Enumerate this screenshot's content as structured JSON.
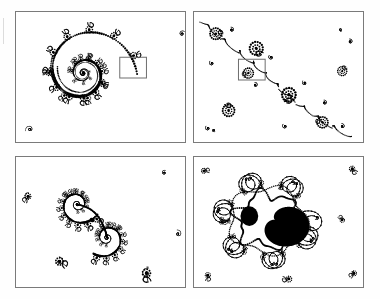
{
  "figure": {
    "background_color": "#ffffff",
    "ink_color": "#000000",
    "frame_color": "#7a7a7a",
    "zoom_box_color": "#6e6e6e",
    "columns": 2,
    "rows": 2,
    "panel_count": 4
  },
  "panels": [
    {
      "id": "panel-1",
      "index": 1,
      "position": "top-left",
      "label": "",
      "caption": "Wide view: single large logarithmic spiral of the Julia set with dendritic seahorse-tail decorations winding inward to a central focus.",
      "motif": "spiral",
      "has_zoom_box": true,
      "zoom_box": {
        "x": 120,
        "y": 57,
        "width": 27,
        "height": 21
      },
      "frame": {
        "x": 15,
        "y": 11,
        "width": 171,
        "height": 132
      }
    },
    {
      "id": "panel-2",
      "index": 2,
      "position": "top-right",
      "label": "",
      "caption": "First magnification: diagonal filament chain of bud clusters and counter-rotating mini spirals running from upper-left to lower-right.",
      "motif": "filament-chain",
      "has_zoom_box": true,
      "zoom_box": {
        "x": 238,
        "y": 59,
        "width": 27,
        "height": 21
      },
      "frame": {
        "x": 193,
        "y": 11,
        "width": 171,
        "height": 132
      }
    },
    {
      "id": "panel-3",
      "index": 3,
      "position": "bottom-left",
      "label": "",
      "caption": "Second magnification: S-shaped double spiral pair with beaded filaments and satellite rosettes in the corners.",
      "motif": "double-spiral",
      "has_zoom_box": false,
      "zoom_box": null,
      "frame": {
        "x": 15,
        "y": 156,
        "width": 171,
        "height": 132
      }
    },
    {
      "id": "panel-4",
      "index": 4,
      "position": "bottom-right",
      "label": "",
      "caption": "Third magnification: embedded solid black mini Mandelbrot island surrounded by a radiating crown of curled tendrils.",
      "motif": "mini-mandelbrot-island",
      "has_zoom_box": false,
      "zoom_box": null,
      "frame": {
        "x": 193,
        "y": 156,
        "width": 171,
        "height": 132
      }
    }
  ],
  "chart_data": {
    "type": "scatter",
    "xlabel": "",
    "ylabel": "",
    "series": [
      {
        "name": "panel-1-spiral",
        "values": []
      },
      {
        "name": "panel-2-filament",
        "values": []
      },
      {
        "name": "panel-3-double-spiral",
        "values": []
      },
      {
        "name": "panel-4-island",
        "values": []
      }
    ]
  }
}
